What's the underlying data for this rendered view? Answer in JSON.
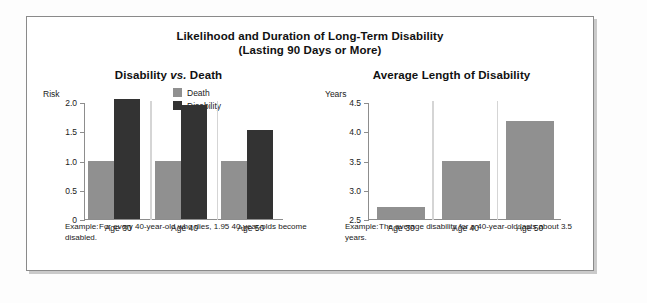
{
  "figure": {
    "title_line1": "Likelihood and Duration of Long-Term Disability",
    "title_line2": "(Lasting 90 Days or More)"
  },
  "left_panel": {
    "title_pre": "Disability ",
    "title_ital": "vs.",
    "title_post": " Death",
    "axis_caption": "Risk",
    "legend": [
      {
        "label": "Death",
        "color": "#909090"
      },
      {
        "label": "Disability",
        "color": "#333333"
      }
    ],
    "note_lead": "Example:",
    "note_body": "For every 40-year-old who dies, 1.95 40-year-olds become disabled."
  },
  "right_panel": {
    "title": "Average Length of Disability",
    "axis_caption": "Years",
    "note_lead": "Example:",
    "note_body": "The average disability for a 40-year-old lasts about 3.5 years."
  },
  "chart_data": [
    {
      "id": "disability-vs-death",
      "type": "bar",
      "title": "Disability vs. Death",
      "xlabel": "",
      "ylabel": "Risk",
      "ylim": [
        0,
        2.0
      ],
      "yticks": [
        "0",
        "0.5",
        "1.0",
        "1.5",
        "2.0"
      ],
      "ytick_values": [
        0,
        0.5,
        1.0,
        1.5,
        2.0
      ],
      "grid": false,
      "legend_position": "top-right",
      "categories": [
        "Age 30",
        "Age 40",
        "Age 50"
      ],
      "series": [
        {
          "name": "Death",
          "color": "#909090",
          "values": [
            1.0,
            1.0,
            1.0
          ]
        },
        {
          "name": "Disability",
          "color": "#333333",
          "values": [
            2.05,
            1.95,
            1.53
          ]
        }
      ]
    },
    {
      "id": "average-length-of-disability",
      "type": "bar",
      "title": "Average Length of Disability",
      "xlabel": "",
      "ylabel": "Years",
      "ylim": [
        2.5,
        4.5
      ],
      "yticks": [
        "2.5",
        "3.0",
        "3.5",
        "4.0",
        "4.5"
      ],
      "ytick_values": [
        2.5,
        3.0,
        3.5,
        4.0,
        4.5
      ],
      "grid": false,
      "legend_position": "none",
      "categories": [
        "Age 30",
        "Age 40",
        "Age 50"
      ],
      "series": [
        {
          "name": "Years",
          "color": "#909090",
          "values": [
            2.7,
            3.5,
            4.17
          ]
        }
      ]
    }
  ]
}
